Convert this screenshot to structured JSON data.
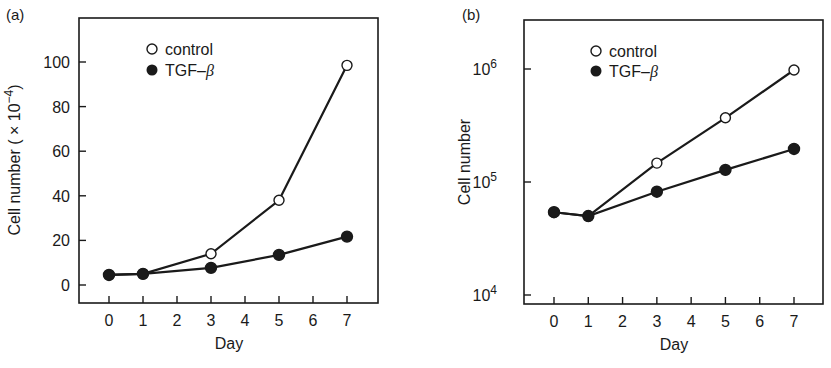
{
  "chart_data": [
    {
      "panel_label": "(a)",
      "type": "line",
      "title": "",
      "xlabel": "Day",
      "ylabel": "Cell number ( × 10⁻⁴)",
      "ylabel_main": "Cell number ( × 10",
      "ylabel_exp": "−4",
      "ylabel_close": ")",
      "yscale": "linear",
      "ylim": [
        -5,
        118
      ],
      "xlim": [
        -0.9,
        7.9
      ],
      "x_ticks": [
        "0",
        "1",
        "2",
        "3",
        "4",
        "5",
        "6",
        "7"
      ],
      "y_ticks": [
        "0",
        "20",
        "40",
        "60",
        "80",
        "100"
      ],
      "grid": false,
      "legend_position": "upper-left-inside",
      "x": [
        0,
        1,
        3,
        5,
        7
      ],
      "series": [
        {
          "name": "control",
          "marker": "open-circle",
          "values": [
            4.5,
            5,
            14,
            38,
            98.5
          ]
        },
        {
          "name": "TGF–β",
          "marker": "filled-circle",
          "values": [
            4.5,
            5,
            7.7,
            13.5,
            21.7
          ]
        }
      ]
    },
    {
      "panel_label": "(b)",
      "type": "line",
      "title": "",
      "xlabel": "Day",
      "ylabel": "Cell number",
      "yscale": "log",
      "ylim": [
        8000,
        2500000
      ],
      "xlim": [
        -0.9,
        7.9
      ],
      "x_ticks": [
        "0",
        "1",
        "2",
        "3",
        "4",
        "5",
        "6",
        "7"
      ],
      "y_ticks": [
        {
          "base": "10",
          "exp": "4",
          "value": 10000
        },
        {
          "base": "10",
          "exp": "5",
          "value": 100000
        },
        {
          "base": "10",
          "exp": "6",
          "value": 1000000
        }
      ],
      "grid": false,
      "legend_position": "upper-left-inside",
      "x": [
        0,
        1,
        3,
        5,
        7
      ],
      "series": [
        {
          "name": "control",
          "marker": "open-circle",
          "values": [
            54000,
            50000,
            147000,
            370000,
            980000
          ]
        },
        {
          "name": "TGF–β",
          "marker": "filled-circle",
          "values": [
            54000,
            50000,
            82000,
            128000,
            196000
          ]
        }
      ]
    }
  ],
  "legend": {
    "control": "control",
    "tgf_prefix": "TGF–",
    "tgf_beta": "β"
  }
}
